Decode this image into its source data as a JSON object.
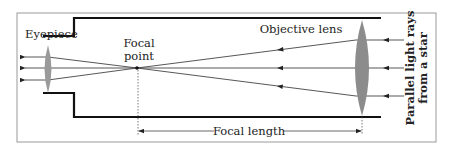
{
  "labels": {
    "eyepiece": "Eyepiece",
    "focal_point_line1": "Focal",
    "focal_point_line2": "point",
    "objective_lens": "Objective lens",
    "parallel_rays_line1": "Parallel light rays",
    "parallel_rays_line2": "from a star",
    "focal_length": "Focal length"
  },
  "colors": {
    "tube": "#111111",
    "lens": "#8c8c8c",
    "ray": "#444444",
    "frame": "#9a9a9a"
  }
}
